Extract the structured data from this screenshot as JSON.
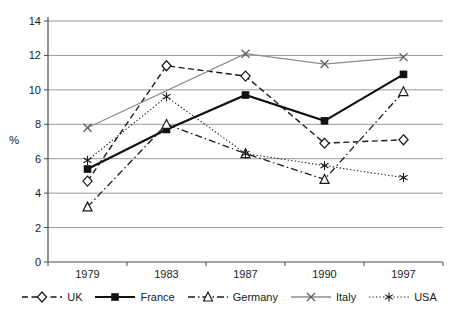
{
  "chart_data": {
    "type": "line",
    "title": "",
    "xlabel": "",
    "ylabel": "%",
    "categories": [
      "1979",
      "1983",
      "1987",
      "1990",
      "1997"
    ],
    "ylim": [
      0,
      14
    ],
    "ytick_step": 2,
    "grid": true,
    "legend_position": "bottom",
    "series": [
      {
        "name": "UK",
        "values": [
          4.7,
          11.4,
          10.8,
          6.9,
          7.1
        ],
        "color": "#1a1a1a",
        "line": "dashed",
        "marker": "diamond-open",
        "width": 1.4
      },
      {
        "name": "France",
        "values": [
          5.4,
          7.7,
          9.7,
          8.2,
          10.9
        ],
        "color": "#111111",
        "line": "solid",
        "marker": "square-filled",
        "width": 2.2
      },
      {
        "name": "Germany",
        "values": [
          3.2,
          8.0,
          6.3,
          4.8,
          9.9
        ],
        "color": "#1a1a1a",
        "line": "dashdot",
        "marker": "triangle-open",
        "width": 1.3
      },
      {
        "name": "Italy",
        "values": [
          7.8,
          null,
          12.1,
          11.5,
          11.9
        ],
        "color": "#8c8c8c",
        "line": "solid",
        "marker": "x-cross",
        "width": 1.3,
        "marker_color": "#5f5f5f"
      },
      {
        "name": "USA",
        "values": [
          5.9,
          9.6,
          6.3,
          5.6,
          4.9
        ],
        "color": "#1a1a1a",
        "line": "dotted",
        "marker": "asterisk",
        "width": 1.1
      }
    ],
    "colors": {
      "grid": "#999999",
      "axis": "#4a4a4a",
      "text": "#1a1a1a",
      "marker_fill": "#ffffff",
      "background": "#ffffff"
    }
  }
}
